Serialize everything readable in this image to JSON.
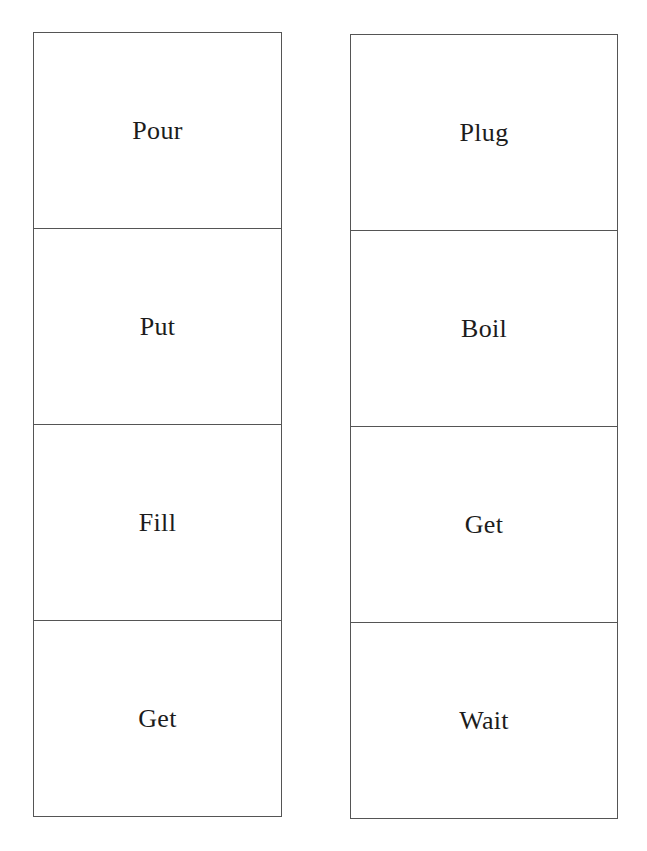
{
  "page": {
    "type": "word-card-worksheet"
  },
  "columns": [
    {
      "id": "left",
      "cards": [
        {
          "word": "Pour"
        },
        {
          "word": "Put"
        },
        {
          "word": "Fill"
        },
        {
          "word": "Get"
        }
      ]
    },
    {
      "id": "right",
      "cards": [
        {
          "word": "Plug"
        },
        {
          "word": "Boil"
        },
        {
          "word": "Get"
        },
        {
          "word": "Wait"
        }
      ]
    }
  ],
  "colors": {
    "background": "#ffffff",
    "border": "#555555",
    "text": "#1c1c1c"
  }
}
